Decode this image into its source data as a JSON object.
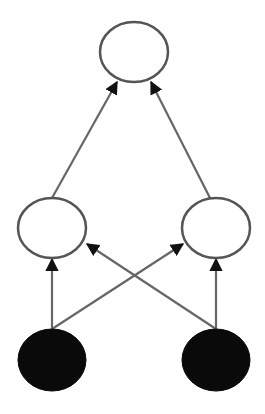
{
  "diagram": {
    "type": "directed-graph",
    "colors": {
      "background": "#ffffff",
      "node_stroke": "#555555",
      "edge": "#666666",
      "arrowhead": "#111111",
      "filled_node": "#0a0a0a",
      "open_node": "#ffffff"
    },
    "nodes": [
      {
        "id": "output",
        "layer": "top",
        "filled": false,
        "cx": 134,
        "cy": 52,
        "rx": 34,
        "ry": 30
      },
      {
        "id": "hidden-left",
        "layer": "middle",
        "filled": false,
        "cx": 52,
        "cy": 228,
        "rx": 34,
        "ry": 30
      },
      {
        "id": "hidden-right",
        "layer": "middle",
        "filled": false,
        "cx": 216,
        "cy": 228,
        "rx": 34,
        "ry": 30
      },
      {
        "id": "input-left",
        "layer": "bottom",
        "filled": true,
        "cx": 52,
        "cy": 360,
        "rx": 34,
        "ry": 31
      },
      {
        "id": "input-right",
        "layer": "bottom",
        "filled": true,
        "cx": 216,
        "cy": 360,
        "rx": 34,
        "ry": 31
      }
    ],
    "edges": [
      {
        "from": "hidden-left",
        "to": "output",
        "x1": 52,
        "y1": 198,
        "x2": 117,
        "y2": 82
      },
      {
        "from": "hidden-right",
        "to": "output",
        "x1": 210,
        "y1": 198,
        "x2": 151,
        "y2": 82
      },
      {
        "from": "input-left",
        "to": "hidden-left",
        "x1": 52,
        "y1": 329,
        "x2": 52,
        "y2": 259
      },
      {
        "from": "input-right",
        "to": "hidden-right",
        "x1": 216,
        "y1": 329,
        "x2": 216,
        "y2": 259
      },
      {
        "from": "input-left",
        "to": "hidden-right",
        "x1": 52,
        "y1": 329,
        "x2": 183,
        "y2": 244
      },
      {
        "from": "input-right",
        "to": "hidden-left",
        "x1": 216,
        "y1": 329,
        "x2": 87,
        "y2": 244
      }
    ]
  }
}
